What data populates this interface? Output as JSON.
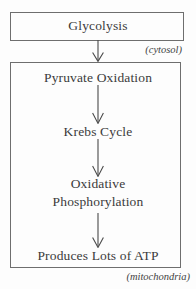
{
  "diagram": {
    "type": "flowchart",
    "orientation": "vertical",
    "stroke_color": "#6e6e6e",
    "text_color": "#3b3b3b",
    "background_color": "#fdfdfd"
  },
  "compartments": [
    {
      "id": "cytosol",
      "label": "(cytosol)",
      "stage_ids": [
        "glycolysis"
      ]
    },
    {
      "id": "mitochondria",
      "label": "(mitochondria)",
      "stage_ids": [
        "pyruvate-oxidation",
        "krebs-cycle",
        "oxidative-phosphorylation",
        "produces-atp"
      ]
    }
  ],
  "stages": [
    {
      "id": "glycolysis",
      "label": "Glycolysis",
      "lines": [
        "Glycolysis"
      ],
      "boxed": true
    },
    {
      "id": "pyruvate-oxidation",
      "label": "Pyruvate Oxidation",
      "lines": [
        "Pyruvate Oxidation"
      ],
      "boxed": false
    },
    {
      "id": "krebs-cycle",
      "label": "Krebs Cycle",
      "lines": [
        "Krebs Cycle"
      ],
      "boxed": false
    },
    {
      "id": "oxidative-phosphorylation",
      "label": "Oxidative Phosphorylation",
      "lines": [
        "Oxidative",
        "Phosphorylation"
      ],
      "boxed": false
    },
    {
      "id": "produces-atp",
      "label": "Produces Lots of ATP",
      "lines": [
        "Produces Lots of ATP"
      ],
      "boxed": false
    }
  ],
  "connectors": [
    {
      "id": "arrow-1",
      "from": "glycolysis",
      "to": "pyruvate-oxidation",
      "style": "arrow-down"
    },
    {
      "id": "arrow-2",
      "from": "pyruvate-oxidation",
      "to": "krebs-cycle",
      "style": "arrow-down"
    },
    {
      "id": "arrow-3",
      "from": "krebs-cycle",
      "to": "oxidative-phosphorylation",
      "style": "arrow-down"
    },
    {
      "id": "arrow-4",
      "from": "oxidative-phosphorylation",
      "to": "produces-atp",
      "style": "arrow-down"
    }
  ]
}
